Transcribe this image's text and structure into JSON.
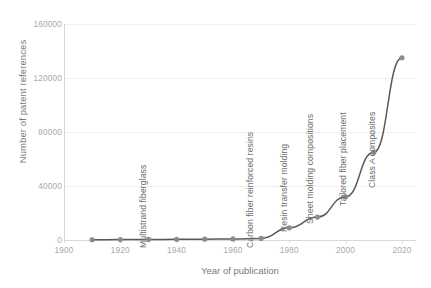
{
  "chart_data": {
    "type": "line",
    "title": "",
    "xlabel": "Year of publication",
    "ylabel": "Number of patent references",
    "xlim": [
      1900,
      2025
    ],
    "ylim": [
      0,
      160000
    ],
    "x_ticks": [
      "1900",
      "1920",
      "1940",
      "1960",
      "1980",
      "2000",
      "2020"
    ],
    "x_tick_values": [
      1900,
      1920,
      1940,
      1960,
      1980,
      2000,
      2020
    ],
    "y_ticks": [
      "0",
      "40000",
      "80000",
      "120000",
      "160000"
    ],
    "y_tick_values": [
      0,
      40000,
      80000,
      120000,
      160000
    ],
    "grid": "horizontal",
    "legend": "none",
    "x": [
      1910,
      1920,
      1930,
      1940,
      1950,
      1960,
      1970,
      1980,
      1990,
      2000,
      2010,
      2020
    ],
    "values": [
      200,
      300,
      400,
      500,
      600,
      800,
      1200,
      9000,
      17000,
      32000,
      65000,
      135000
    ],
    "series": [
      {
        "name": "Number of patent references",
        "color": "#595959",
        "marker": "circle",
        "values": [
          200,
          300,
          400,
          500,
          600,
          800,
          1200,
          9000,
          17000,
          32000,
          65000,
          135000
        ]
      }
    ],
    "annotations": [
      {
        "text": "Multistrand fiberglass",
        "x": 1930,
        "y_px_bottom": 238
      },
      {
        "text": "Carbon fiber reinforced resins",
        "x": 1968,
        "y_px_bottom": 238
      },
      {
        "text": "Resin transfer molding",
        "x": 1980,
        "y_px_bottom": 222
      },
      {
        "text": "Sheet molding compositions",
        "x": 1989,
        "y_px_bottom": 214
      },
      {
        "text": "Tailored fiber placement",
        "x": 2001,
        "y_px_bottom": 196
      },
      {
        "text": "Class A composites",
        "x": 2011,
        "y_px_bottom": 178
      }
    ]
  }
}
